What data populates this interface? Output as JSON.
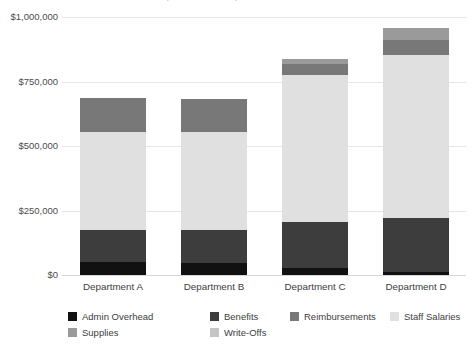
{
  "chart_data": {
    "type": "bar",
    "stacked": true,
    "title": "Departmental Expense Breakdown",
    "xlabel": "",
    "ylabel": "",
    "ylim": [
      0,
      1000000
    ],
    "grid": true,
    "legend_position": "bottom",
    "categories": [
      "Department A",
      "Department B",
      "Department C",
      "Department D"
    ],
    "y_tick_labels": [
      "$1,000,000",
      "$750,000",
      "$500,000",
      "$250,000",
      "$0"
    ],
    "y_tick_values": [
      1000000,
      750000,
      500000,
      250000,
      0
    ],
    "series": [
      {
        "name": "Admin Overhead",
        "color": "#111111",
        "values": [
          50000,
          47000,
          27000,
          12000
        ]
      },
      {
        "name": "Benefits",
        "color": "#3d3d3d",
        "values": [
          123000,
          126000,
          178000,
          209000
        ]
      },
      {
        "name": "Staff Salaries",
        "color": "#e0e0e0",
        "values": [
          381000,
          381000,
          570000,
          633000
        ]
      },
      {
        "name": "Reimbursements",
        "color": "#787878",
        "values": [
          133000,
          128000,
          43000,
          55000
        ]
      },
      {
        "name": "Supplies",
        "color": "#9a9a9a",
        "values": [
          0,
          0,
          20000,
          48000
        ]
      },
      {
        "name": "Write-Offs",
        "color": "#c4c4c4",
        "values": [
          0,
          0,
          0,
          0
        ]
      }
    ],
    "totals": [
      687000,
      682000,
      838000,
      957000
    ]
  },
  "legend": {
    "row1": [
      {
        "label": "Admin Overhead",
        "color": "#111111"
      },
      {
        "label": "Benefits",
        "color": "#3d3d3d"
      },
      {
        "label": "Reimbursements",
        "color": "#787878"
      },
      {
        "label": "Staff Salaries",
        "color": "#e0e0e0"
      }
    ],
    "row2": [
      {
        "label": "Supplies",
        "color": "#9a9a9a"
      },
      {
        "label": "Write-Offs",
        "color": "#c4c4c4"
      }
    ]
  }
}
